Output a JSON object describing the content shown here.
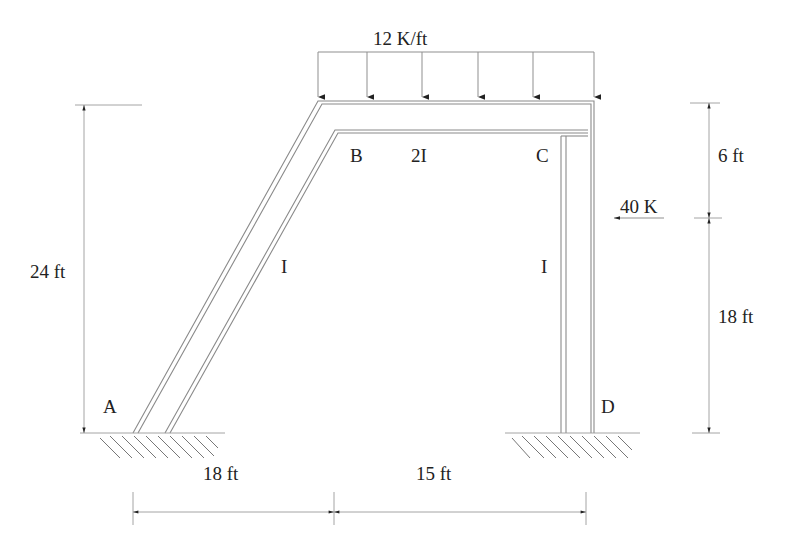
{
  "diagram": {
    "type": "structural-frame",
    "nodes": [
      {
        "id": "A",
        "label": "A",
        "support": "fixed"
      },
      {
        "id": "B",
        "label": "B"
      },
      {
        "id": "C",
        "label": "C"
      },
      {
        "id": "D",
        "label": "D",
        "support": "fixed"
      }
    ],
    "members": [
      {
        "from": "A",
        "to": "B",
        "label": "I",
        "orientation": "inclined"
      },
      {
        "from": "B",
        "to": "C",
        "label": "2I",
        "orientation": "horizontal"
      },
      {
        "from": "C",
        "to": "D",
        "label": "I",
        "orientation": "vertical"
      }
    ],
    "loads": {
      "distributed": {
        "label": "12 K/ft",
        "on_member": "B-C",
        "direction": "down"
      },
      "point": {
        "label": "40 K",
        "direction": "left",
        "on_member": "C-D"
      }
    },
    "dimensions": {
      "left_height": "24 ft",
      "right_top": "6 ft",
      "right_bottom": "18 ft",
      "bottom_left": "18 ft",
      "bottom_right": "15 ft"
    }
  },
  "labels": {
    "node_a": "A",
    "node_b": "B",
    "node_c": "C",
    "node_d": "D",
    "member_ab": "I",
    "member_bc": "2I",
    "member_cd": "I",
    "dist_load": "12 K/ft",
    "point_load": "40 K",
    "dim_left": "24 ft",
    "dim_right_top": "6 ft",
    "dim_right_bottom": "18 ft",
    "dim_bottom_left": "18 ft",
    "dim_bottom_right": "15 ft"
  }
}
